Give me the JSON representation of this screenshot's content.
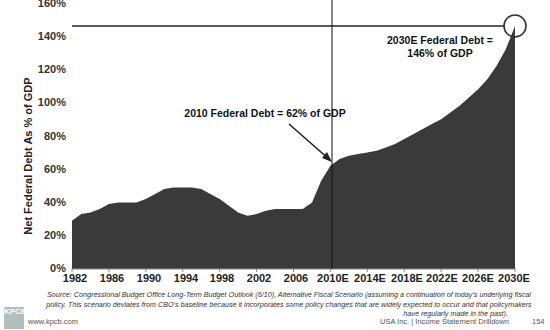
{
  "chart_data": {
    "type": "area",
    "title": "",
    "ylabel": "Net Federal Debt As % of GDP",
    "xlabel": "",
    "ylim": [
      0,
      160
    ],
    "yticks": [
      "0%",
      "20%",
      "40%",
      "60%",
      "80%",
      "100%",
      "120%",
      "140%",
      "160%"
    ],
    "xticks": [
      "1982",
      "1986",
      "1990",
      "1994",
      "1998",
      "2002",
      "2006",
      "2010E",
      "2014E",
      "2018E",
      "2022E",
      "2026E",
      "2030E"
    ],
    "grid": false,
    "legend": "none",
    "x": [
      1982,
      1983,
      1984,
      1985,
      1986,
      1987,
      1988,
      1989,
      1990,
      1991,
      1992,
      1993,
      1994,
      1995,
      1996,
      1997,
      1998,
      1999,
      2000,
      2001,
      2002,
      2003,
      2004,
      2005,
      2006,
      2007,
      2008,
      2009,
      2010,
      2011,
      2012,
      2013,
      2014,
      2015,
      2016,
      2017,
      2018,
      2019,
      2020,
      2021,
      2022,
      2023,
      2024,
      2025,
      2026,
      2027,
      2028,
      2029,
      2030
    ],
    "series": [
      {
        "name": "Net Federal Debt (% of GDP)",
        "values": [
          29,
          33,
          34,
          36,
          39,
          40,
          40,
          40,
          42,
          45,
          48,
          49,
          49,
          49,
          48,
          45,
          42,
          38,
          34,
          32,
          33,
          35,
          36,
          36,
          36,
          36,
          40,
          53,
          62,
          66,
          68,
          69,
          70,
          71,
          73,
          75,
          78,
          81,
          84,
          87,
          90,
          94,
          98,
          103,
          108,
          114,
          122,
          132,
          146
        ]
      }
    ],
    "annotations": [
      {
        "text": "2010 Federal Debt = 62% of GDP",
        "x": 2010,
        "y": 62
      },
      {
        "text": "2030E Federal Debt = 146% of GDP",
        "x": 2030,
        "y": 146
      }
    ],
    "reference_lines": [
      {
        "type": "horizontal",
        "y": 146
      },
      {
        "type": "vertical",
        "x": 2010
      }
    ]
  },
  "annotations": {
    "a2010": "2010 Federal Debt = 62% of GDP",
    "a2030_line1": "2030E Federal Debt =",
    "a2030_line2": "146% of GDP"
  },
  "source": {
    "line1": "Source: Congressional Budget Office Long-Term Budget Outlook (6/10), Alternative Fiscal Scenario (assuming a continuation of today's underlying fiscal",
    "line2": "policy. This scenario deviates from CBO's baseline because it incorporates some policy changes that are widely expected to occur and that policymakers",
    "line3": "have regularly made in the past)."
  },
  "footer": {
    "logo_text": "KPCB",
    "url": "www.kpcb.com",
    "deck": "USA Inc. | Income Statement Drilldown",
    "page": "154"
  }
}
